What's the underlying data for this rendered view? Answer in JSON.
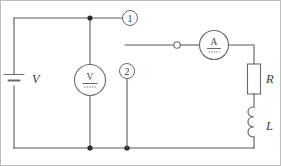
{
  "figure": {
    "type": "electrical-schematic",
    "width": 281,
    "height": 166,
    "background_color": "#ffffff",
    "wire_color": "#5a5a5a",
    "frame_color": "#bdbdbd"
  },
  "labels": {
    "source": "V",
    "resistor": "R",
    "inductor": "L",
    "voltmeter_glyph": "V",
    "ammeter_glyph": "A",
    "terminal_1": "1",
    "terminal_2": "2"
  },
  "components": [
    {
      "name": "battery",
      "label": "V",
      "symbol": "dc-source"
    },
    {
      "name": "voltmeter",
      "label": "V",
      "symbol": "circle-meter"
    },
    {
      "name": "ammeter",
      "label": "A",
      "symbol": "circle-meter"
    },
    {
      "name": "resistor",
      "label": "R",
      "symbol": "rectangle"
    },
    {
      "name": "inductor",
      "label": "L",
      "symbol": "coil"
    },
    {
      "name": "open-terminal",
      "label": "",
      "symbol": "open-circle"
    }
  ],
  "terminals": [
    {
      "id": "1",
      "label": "1"
    },
    {
      "id": "2",
      "label": "2"
    }
  ]
}
